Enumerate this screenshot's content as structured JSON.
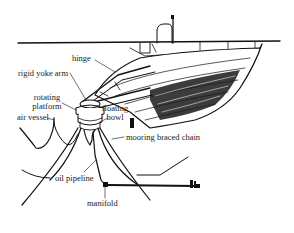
{
  "diagram": {
    "type": "single point mooring system with rigid yoke arm",
    "labels": {
      "hinge": "hinge",
      "rigid_yoke_arm": "rigid yoke arm",
      "rotating_platform_line1": "rotating",
      "rotating_platform_line2": "platform",
      "floating_bowl_line1": "floating",
      "floating_bowl_line2": "bowl",
      "air_vessel": "air vessel",
      "mooring_braced_chain": "mooring braced chain",
      "oil_pipeline": "oil pipeline",
      "manifold": "manifold"
    },
    "components": [
      "ship hull",
      "ship superstructure",
      "water surface line",
      "rigid yoke arm",
      "hinge",
      "rotating platform",
      "floating bowl",
      "air vessel",
      "mooring braced chains",
      "oil pipeline",
      "manifold",
      "subsea pipeline"
    ]
  }
}
